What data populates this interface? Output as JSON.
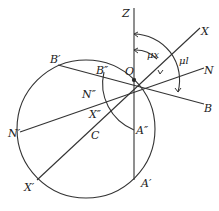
{
  "figure": {
    "type": "geometric-diagram",
    "labels": {
      "Z": "Z",
      "O": "O",
      "X": "X",
      "N": "N",
      "B": "B",
      "B_prime": "B′",
      "B_dprime": "B″",
      "N_prime": "N′",
      "N_dprime": "N″",
      "X_prime": "X′",
      "X_dprime": "X″",
      "C": "C",
      "A_prime": "A′",
      "A_dprime": "A″",
      "angle_mux": "μx",
      "angle_mul": "μl"
    }
  }
}
